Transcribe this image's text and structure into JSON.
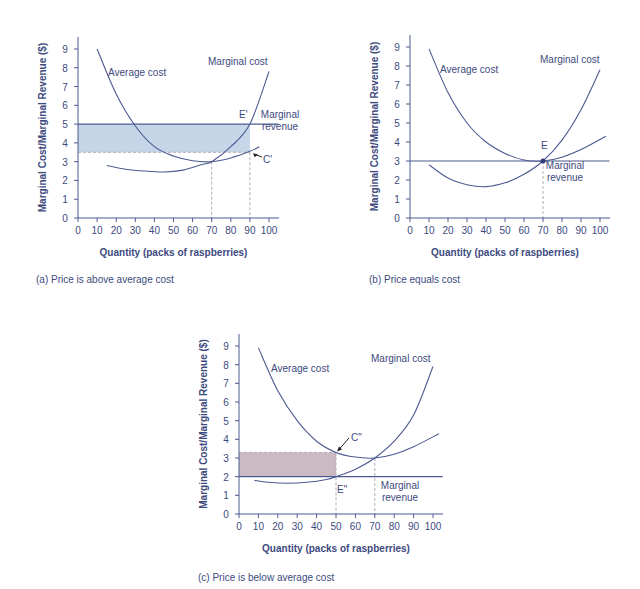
{
  "colors": {
    "axis": "#4a5a90",
    "curve": "#4d5a92",
    "text": "#3d4a7e",
    "guide": "#b0a8b8",
    "profit_fill": "#c4d6e8",
    "loss_fill": "#cbb9c4"
  },
  "chart_data": [
    {
      "id": "a",
      "type": "line",
      "title": "(a) Price is above average cost",
      "xlabel": "Quantity (packs of raspberries)",
      "ylabel": "Marginal Cost/Marginal Revenue ($)",
      "xlim": [
        0,
        100
      ],
      "ylim": [
        0,
        9
      ],
      "xticks": [
        0,
        10,
        20,
        30,
        40,
        50,
        60,
        70,
        80,
        90,
        100
      ],
      "yticks": [
        0,
        1,
        2,
        3,
        4,
        5,
        6,
        7,
        8,
        9
      ],
      "grid": false,
      "series": [
        {
          "name": "Average cost",
          "x": [
            10,
            20,
            30,
            40,
            50,
            60,
            70,
            80,
            90,
            95
          ],
          "y": [
            9.0,
            6.6,
            4.9,
            3.8,
            3.3,
            3.05,
            3.0,
            3.2,
            3.55,
            3.8
          ]
        },
        {
          "name": "Marginal cost",
          "x": [
            15,
            25,
            35,
            45,
            55,
            65,
            70,
            80,
            90,
            100
          ],
          "y": [
            2.8,
            2.6,
            2.5,
            2.45,
            2.55,
            2.85,
            3.0,
            3.8,
            5.0,
            7.8
          ]
        },
        {
          "name": "Marginal revenue",
          "x": [
            0,
            105
          ],
          "y": [
            5.0,
            5.0
          ]
        }
      ],
      "annotations": [
        {
          "label": "E'",
          "x": 90,
          "y": 5.0
        },
        {
          "label": "C'",
          "x": 90,
          "y": 3.55
        }
      ],
      "shaded_region": {
        "x": [
          0,
          90
        ],
        "y": [
          3.5,
          5.0
        ],
        "meaning": "profit"
      },
      "guides": [
        {
          "x": 70,
          "y": 3.0
        },
        {
          "x": 90,
          "y": 3.5
        }
      ]
    },
    {
      "id": "b",
      "type": "line",
      "title": "(b) Price equals cost",
      "xlabel": "Quantity (packs of raspberries)",
      "ylabel": "Marginal Cost/Marginal Revenue ($)",
      "xlim": [
        0,
        100
      ],
      "ylim": [
        0,
        9
      ],
      "xticks": [
        0,
        10,
        20,
        30,
        40,
        50,
        60,
        70,
        80,
        90,
        100
      ],
      "yticks": [
        0,
        1,
        2,
        3,
        4,
        5,
        6,
        7,
        8,
        9
      ],
      "grid": false,
      "series": [
        {
          "name": "Average cost",
          "x": [
            10,
            20,
            30,
            40,
            50,
            60,
            70,
            80,
            90,
            103
          ],
          "y": [
            8.9,
            6.6,
            5.0,
            4.0,
            3.4,
            3.05,
            3.0,
            3.2,
            3.6,
            4.3
          ]
        },
        {
          "name": "Marginal cost",
          "x": [
            10,
            20,
            30,
            40,
            50,
            60,
            70,
            80,
            90,
            100
          ],
          "y": [
            2.8,
            2.1,
            1.75,
            1.65,
            1.85,
            2.3,
            3.0,
            4.1,
            5.7,
            7.8
          ]
        },
        {
          "name": "Marginal revenue",
          "x": [
            0,
            105
          ],
          "y": [
            3.0,
            3.0
          ]
        }
      ],
      "annotations": [
        {
          "label": "E",
          "x": 70,
          "y": 3.0
        }
      ],
      "guides": [
        {
          "x": 70,
          "y": 3.0
        }
      ]
    },
    {
      "id": "c",
      "type": "line",
      "title": "(c) Price is below average cost",
      "xlabel": "Quantity (packs of raspberries)",
      "ylabel": "Marginal Cost/Marginal Revenue ($)",
      "xlim": [
        0,
        100
      ],
      "ylim": [
        0,
        9
      ],
      "xticks": [
        0,
        10,
        20,
        30,
        40,
        50,
        60,
        70,
        80,
        90,
        100
      ],
      "yticks": [
        0,
        1,
        2,
        3,
        4,
        5,
        6,
        7,
        8,
        9
      ],
      "grid": false,
      "series": [
        {
          "name": "Average cost",
          "x": [
            10,
            20,
            30,
            40,
            50,
            60,
            70,
            80,
            90,
            103
          ],
          "y": [
            8.9,
            6.6,
            5.0,
            3.9,
            3.3,
            3.05,
            3.0,
            3.2,
            3.6,
            4.3
          ]
        },
        {
          "name": "Marginal cost",
          "x": [
            8,
            15,
            25,
            35,
            45,
            50,
            60,
            70,
            80,
            90,
            100
          ],
          "y": [
            1.8,
            1.7,
            1.65,
            1.7,
            1.85,
            2.0,
            2.4,
            3.0,
            3.9,
            5.3,
            7.9
          ]
        },
        {
          "name": "Marginal revenue",
          "x": [
            0,
            105
          ],
          "y": [
            2.0,
            2.0
          ]
        }
      ],
      "annotations": [
        {
          "label": "C\"",
          "x": 50,
          "y": 3.3
        },
        {
          "label": "E\"",
          "x": 50,
          "y": 2.0
        }
      ],
      "shaded_region": {
        "x": [
          0,
          50
        ],
        "y": [
          2.0,
          3.3
        ],
        "meaning": "loss"
      },
      "guides": [
        {
          "x": 50,
          "y": 3.3
        },
        {
          "x": 70,
          "y": 3.0
        }
      ]
    }
  ],
  "panels": [
    {
      "caption": "(a) Price is above average cost",
      "label_average_cost": "Average cost",
      "label_marginal_cost": "Marginal cost",
      "label_mr_line1": "Marginal",
      "label_mr_line2": "revenue",
      "point_upper": "E'",
      "point_lower": "C'"
    },
    {
      "caption": "(b) Price equals cost",
      "label_average_cost": "Average cost",
      "label_marginal_cost": "Marginal cost",
      "label_mr_line1": "Marginal",
      "label_mr_line2": "revenue",
      "point_upper": "E"
    },
    {
      "caption": "(c) Price is below average cost",
      "label_average_cost": "Average cost",
      "label_marginal_cost": "Marginal cost",
      "label_mr_line1": "Marginal",
      "label_mr_line2": "revenue",
      "point_upper": "C\"",
      "point_lower": "E\""
    }
  ],
  "axis": {
    "xlabel": "Quantity (packs of raspberries)",
    "ylabel": "Marginal Cost/Marginal Revenue ($)"
  }
}
